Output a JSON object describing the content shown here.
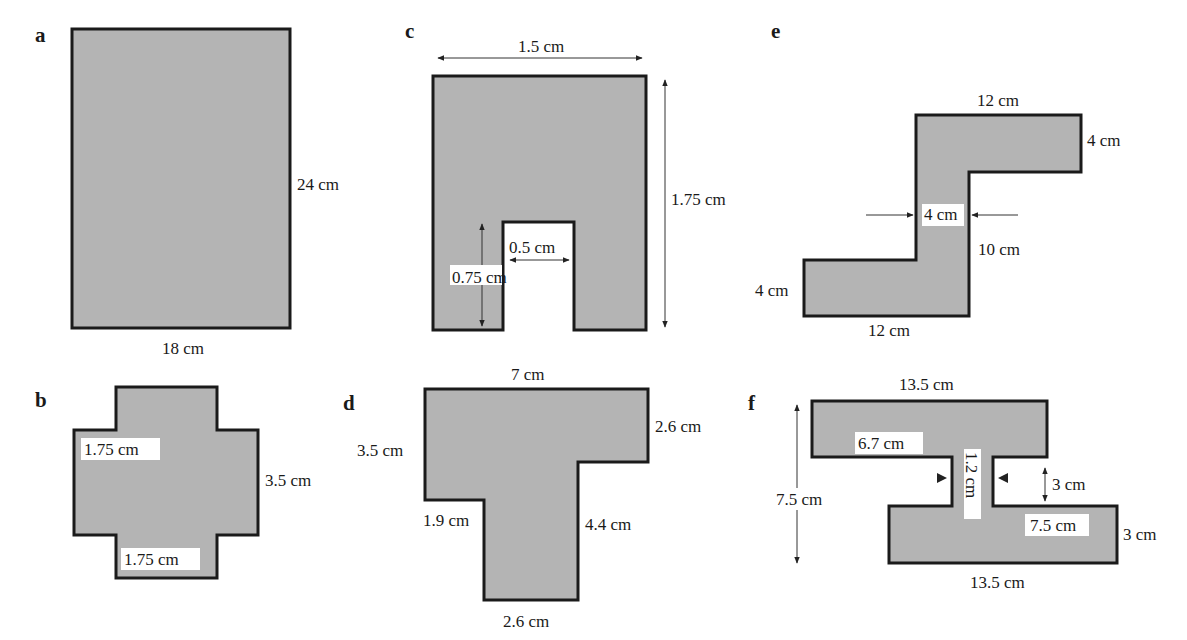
{
  "figures": {
    "a": {
      "letter": "a",
      "shape": "rectangle",
      "labels": {
        "height": "24 cm",
        "width": "18 cm"
      }
    },
    "b": {
      "letter": "b",
      "shape": "cross",
      "labels": {
        "arm_left": "1.75 cm",
        "height": "3.5 cm",
        "arm_bottom": "1.75 cm"
      }
    },
    "c": {
      "letter": "c",
      "shape": "rectangle-with-notch",
      "labels": {
        "width": "1.5 cm",
        "height": "1.75 cm",
        "notch_width": "0.5 cm",
        "notch_height": "0.75 cm"
      }
    },
    "d": {
      "letter": "d",
      "shape": "T-shape",
      "labels": {
        "top": "7 cm",
        "right_top": "2.6 cm",
        "left": "3.5 cm",
        "left_lower": "1.9 cm",
        "right_lower": "4.4 cm",
        "bottom": "2.6 cm"
      }
    },
    "e": {
      "letter": "e",
      "shape": "Z-shape",
      "labels": {
        "top": "12 cm",
        "right": "4 cm",
        "stem_width": "4 cm",
        "stem_height": "10 cm",
        "left": "4 cm",
        "bottom": "12 cm"
      }
    },
    "f": {
      "letter": "f",
      "shape": "offset-I-beam",
      "labels": {
        "top": "13.5 cm",
        "top_inner": "6.7 cm",
        "web_width": "1.2 cm",
        "gap": "3 cm",
        "total_height": "7.5 cm",
        "bottom_inner": "7.5 cm",
        "right": "3 cm",
        "bottom": "13.5 cm"
      }
    }
  },
  "colors": {
    "fill": "#b4b4b4",
    "stroke": "#1a1a1a",
    "text": "#1a1a1a"
  }
}
